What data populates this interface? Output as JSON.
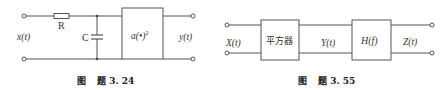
{
  "figure_left": {
    "caption_prefix": "图",
    "caption": "题 3. 24",
    "input_label": "x(t)",
    "output_label": "y(t)",
    "resistor_label": "R",
    "capacitor_label": "C",
    "block_label": "a(•)",
    "block_superscript": "2"
  },
  "figure_right": {
    "caption_prefix": "图",
    "caption": "题 3. 55",
    "input_label": "X(t)",
    "middle_label": "Y(t)",
    "output_label": "Z(t)",
    "block1_label": "平方器",
    "block2_label": "H(f)"
  },
  "colors": {
    "line": "#555555",
    "text": "#333333",
    "background": "#ffffff"
  }
}
